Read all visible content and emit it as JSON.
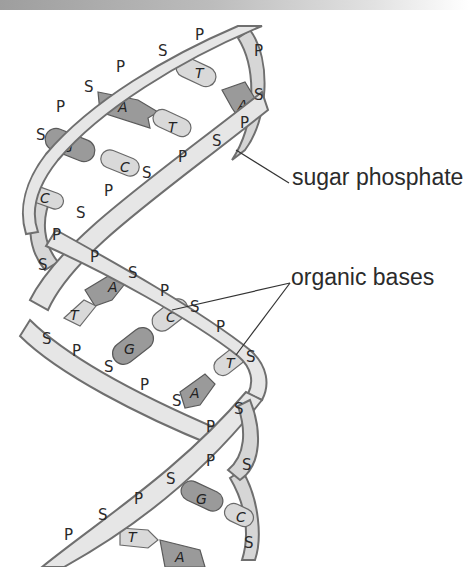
{
  "diagram": {
    "labels": {
      "sugar_phosphate": "sugar phosphate",
      "organic_bases": "organic bases"
    },
    "backbone_letters": {
      "sugar": "S",
      "phosphate": "P"
    },
    "base_pairs": [
      {
        "left": "T",
        "right": "A"
      },
      {
        "left": "A",
        "right": "T"
      },
      {
        "left": "G",
        "right": "C"
      },
      {
        "left": "C",
        "right": "G"
      },
      {
        "left": "A",
        "right": "T"
      },
      {
        "left": "C",
        "right": "G"
      },
      {
        "left": "T",
        "right": "A"
      },
      {
        "left": "G",
        "right": "C"
      },
      {
        "left": "T",
        "right": "A"
      }
    ],
    "colors": {
      "strand_fill": "#e6e6e6",
      "strand_outline": "#6f6f6f",
      "base_dark": "#9a9a9a",
      "base_light": "#d9d9d9",
      "text": "#2b2b2b"
    }
  }
}
